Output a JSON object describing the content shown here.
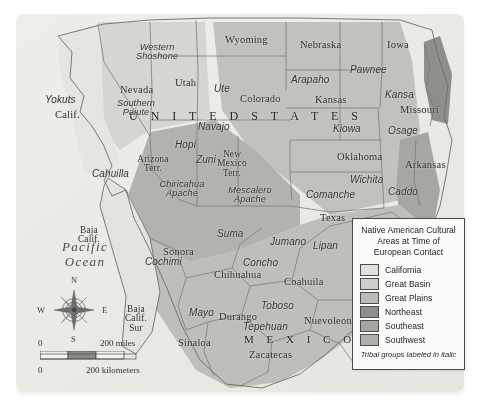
{
  "map": {
    "title_country_us": "U N I T E D   S T A T E S",
    "title_country_mx": "M E X I C O",
    "ocean_label": "Pacific\nOcean",
    "states": [
      {
        "name": "Nevada",
        "x": 120,
        "y": 85
      },
      {
        "name": "Utah",
        "x": 175,
        "y": 78
      },
      {
        "name": "Wyoming",
        "x": 225,
        "y": 35
      },
      {
        "name": "Nebraska",
        "x": 300,
        "y": 40
      },
      {
        "name": "Iowa",
        "x": 387,
        "y": 40
      },
      {
        "name": "Colorado",
        "x": 240,
        "y": 94
      },
      {
        "name": "Kansas",
        "x": 315,
        "y": 95
      },
      {
        "name": "Missouri",
        "x": 400,
        "y": 105
      },
      {
        "name": "Calif.",
        "x": 55,
        "y": 110
      },
      {
        "name": "Arizona\nTerr.",
        "x": 153,
        "y": 155
      },
      {
        "name": "New\nMexico\nTerr.",
        "x": 232,
        "y": 150
      },
      {
        "name": "Oklahoma",
        "x": 337,
        "y": 152
      },
      {
        "name": "Arkansas",
        "x": 405,
        "y": 160
      },
      {
        "name": "Texas",
        "x": 320,
        "y": 213
      },
      {
        "name": "Baja\nCalif.",
        "x": 89,
        "y": 226
      },
      {
        "name": "Sonora",
        "x": 163,
        "y": 247
      },
      {
        "name": "Chihuahua",
        "x": 214,
        "y": 270
      },
      {
        "name": "Coahuila",
        "x": 284,
        "y": 277
      },
      {
        "name": "Baja\nCalif.\nSur",
        "x": 136,
        "y": 305
      },
      {
        "name": "Durango",
        "x": 219,
        "y": 312
      },
      {
        "name": "Nuevoleon",
        "x": 304,
        "y": 316
      },
      {
        "name": "Sinaloa",
        "x": 178,
        "y": 338
      },
      {
        "name": "Zacatecas",
        "x": 249,
        "y": 350
      }
    ],
    "tribes": [
      {
        "name": "Western\nShoshone",
        "x": 157,
        "y": 43
      },
      {
        "name": "Southern\nPaiute",
        "x": 136,
        "y": 99
      },
      {
        "name": "Ute",
        "x": 214,
        "y": 84
      },
      {
        "name": "Arapaho",
        "x": 291,
        "y": 75
      },
      {
        "name": "Pawnee",
        "x": 350,
        "y": 65
      },
      {
        "name": "Kansa",
        "x": 385,
        "y": 90
      },
      {
        "name": "Yokuts",
        "x": 45,
        "y": 95
      },
      {
        "name": "Osage",
        "x": 388,
        "y": 126
      },
      {
        "name": "Kiowa",
        "x": 333,
        "y": 124
      },
      {
        "name": "Navajo",
        "x": 198,
        "y": 122
      },
      {
        "name": "Hopi",
        "x": 175,
        "y": 140
      },
      {
        "name": "Zuni",
        "x": 196,
        "y": 155
      },
      {
        "name": "Cahuilla",
        "x": 92,
        "y": 169
      },
      {
        "name": "Chiricahua\nApache",
        "x": 182,
        "y": 180
      },
      {
        "name": "Mescalero\nApache",
        "x": 250,
        "y": 186
      },
      {
        "name": "Comanche",
        "x": 306,
        "y": 190
      },
      {
        "name": "Wichita",
        "x": 350,
        "y": 175
      },
      {
        "name": "Caddo",
        "x": 388,
        "y": 187
      },
      {
        "name": "Suma",
        "x": 217,
        "y": 229
      },
      {
        "name": "Jumano",
        "x": 270,
        "y": 237
      },
      {
        "name": "Lipan",
        "x": 313,
        "y": 241
      },
      {
        "name": "Cochimi",
        "x": 145,
        "y": 257
      },
      {
        "name": "Concho",
        "x": 243,
        "y": 258
      },
      {
        "name": "Toboso",
        "x": 261,
        "y": 301
      },
      {
        "name": "Mayo",
        "x": 189,
        "y": 308
      },
      {
        "name": "Tepehuan",
        "x": 243,
        "y": 322
      }
    ]
  },
  "legend": {
    "title": "Native American Cultural Areas at Time of European Contact",
    "items": [
      {
        "label": "California",
        "color": "#e2e2dd"
      },
      {
        "label": "Great Basin",
        "color": "#cfcfca"
      },
      {
        "label": "Great Plains",
        "color": "#bcbcb7"
      },
      {
        "label": "Northeast",
        "color": "#8e8e8a"
      },
      {
        "label": "Southeast",
        "color": "#a5a5a0"
      },
      {
        "label": "Southwest",
        "color": "#b0b0ab"
      }
    ],
    "note": "Tribal groups labeled in italic"
  },
  "compass": {
    "north": "N",
    "south": "S",
    "east": "E",
    "west": "W"
  },
  "scale": {
    "miles_zero": "0",
    "miles_label": "200 miles",
    "km_zero": "0",
    "km_label": "200 kilometers"
  }
}
